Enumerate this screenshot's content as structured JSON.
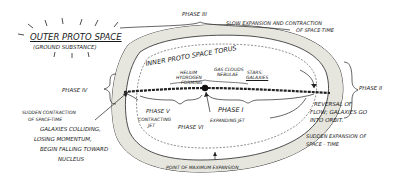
{
  "diagram": {
    "type": "hand-drawn cosmology diagram",
    "outer": {
      "title": "OUTER PROTO SPACE",
      "subtitle": "(GROUND SUBSTANCE)"
    },
    "torus_label": "INNER PROTO SPACE TORUS",
    "center": {
      "helium": "HELIUM",
      "hydrogen": "HYDROGEN",
      "forming": "FORMING",
      "gas_clouds": "GAS CLOUDS",
      "nebulae": "NEBULAE",
      "stars": "STARS:",
      "galaxies": "GALAXIES"
    },
    "phases": {
      "phase1": {
        "title": "PHASE I",
        "desc": "EXPANDING JET"
      },
      "phase2": {
        "title": "PHASE II",
        "desc_lines": [
          "REVERSAL OF",
          "FLOW; GALAXIES GO",
          "INTO ORBIT."
        ],
        "desc2_lines": [
          "SUDDEN EXPANSION OF",
          "SPACE - TIME"
        ]
      },
      "phase3": {
        "title": "PHASE III",
        "desc_lines": [
          "SLOW EXPANSION AND CONTRACTION",
          "OF SPACE-TIME"
        ]
      },
      "phase4": {
        "title": "PHASE IV",
        "desc_lines": [
          "SUDDEN CONTRACTION",
          "OF SPACE-TIME"
        ],
        "desc2_lines": [
          "GALAXIES COLLIDING,",
          "LOSING MOMENTUM,",
          "BEGIN FALLING TOWARD",
          "NUCLEUS"
        ]
      },
      "phase5": {
        "title": "PHASE V",
        "desc_lines": [
          "CONTRACTING",
          "JET"
        ]
      },
      "phase6": {
        "title": "PHASE VI"
      }
    },
    "bottom_label": "POINT OF MAXIMUM EXPANSION"
  }
}
